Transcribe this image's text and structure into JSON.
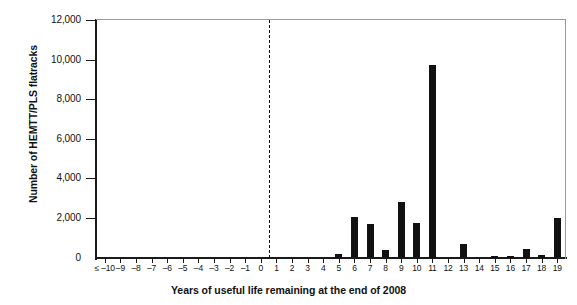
{
  "chart_data": {
    "type": "bar",
    "title": "",
    "xlabel": "Years of useful life remaining at the end of 2008",
    "ylabel": "Number of HEMTT/PLS flatracks",
    "ylim": [
      0,
      12000
    ],
    "ytick_labels": [
      "0",
      "2,000",
      "4,000",
      "6,000",
      "8,000",
      "10,000",
      "12,000"
    ],
    "ytick_values": [
      0,
      2000,
      4000,
      6000,
      8000,
      10000,
      12000
    ],
    "grid": false,
    "legend": null,
    "annotations": [
      {
        "name": "zero-divider",
        "type": "vertical-dashed-line",
        "x": 0.5
      }
    ],
    "categories": [
      "≤ –10",
      "–9",
      "–8",
      "–7",
      "–6",
      "–5",
      "–4",
      "–3",
      "–2",
      "–1",
      "0",
      "1",
      "2",
      "3",
      "4",
      "5",
      "6",
      "7",
      "8",
      "9",
      "10",
      "11",
      "12",
      "13",
      "14",
      "15",
      "16",
      "17",
      "18",
      "19"
    ],
    "values": [
      0,
      0,
      0,
      0,
      0,
      0,
      0,
      0,
      0,
      0,
      0,
      0,
      0,
      0,
      0,
      180,
      2050,
      1700,
      400,
      2800,
      1750,
      9750,
      0,
      700,
      0,
      60,
      60,
      450,
      150,
      2000
    ]
  }
}
